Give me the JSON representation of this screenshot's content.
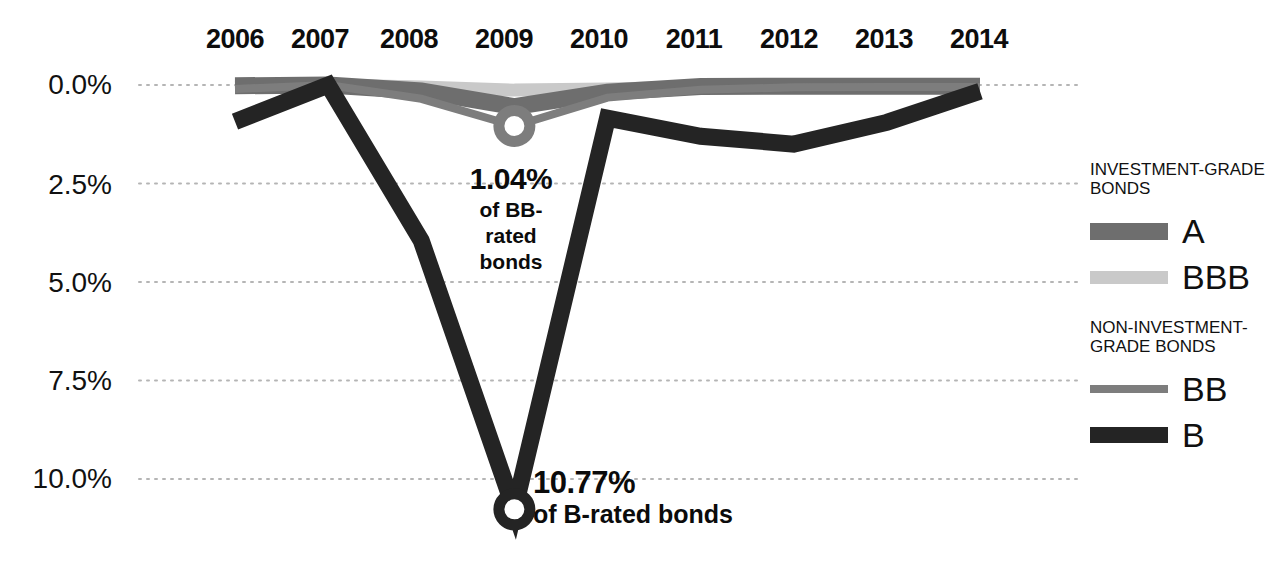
{
  "chart_data": {
    "type": "line",
    "title": "",
    "subtitle": "",
    "xlabel": "",
    "ylabel": "",
    "categories": [
      "2006",
      "2007",
      "2008",
      "2009",
      "2010",
      "2011",
      "2012",
      "2013",
      "2014"
    ],
    "x": [
      2006,
      2007,
      2008,
      2009,
      2010,
      2011,
      2012,
      2013,
      2014
    ],
    "ylim": [
      0.0,
      11.0
    ],
    "y_inverted": true,
    "yticks": [
      "0.0%",
      "2.5%",
      "5.0%",
      "7.5%",
      "10.0%"
    ],
    "ytick_values": [
      0.0,
      2.5,
      5.0,
      7.5,
      10.0
    ],
    "grid": true,
    "grid_style": "dotted-horizontal",
    "legend_position": "right",
    "series": [
      {
        "name": "A",
        "group": "INVESTMENT-GRADE BONDS",
        "color": "#6e6e6e",
        "width": 17,
        "values": [
          0.02,
          0.0,
          0.15,
          0.55,
          0.18,
          0.04,
          0.03,
          0.03,
          0.03
        ]
      },
      {
        "name": "BBB",
        "group": "INVESTMENT-GRADE BONDS",
        "color": "#c9c9c9",
        "width": 13,
        "values": [
          0.05,
          0.0,
          0.05,
          0.13,
          0.1,
          0.05,
          0.04,
          0.04,
          0.04
        ]
      },
      {
        "name": "BB",
        "group": "NON-INVESTMENT-GRADE BONDS",
        "color": "#7d7d7d",
        "width": 8,
        "values": [
          0.1,
          0.0,
          0.35,
          1.04,
          0.32,
          0.12,
          0.06,
          0.05,
          0.05
        ]
      },
      {
        "name": "B",
        "group": "NON-INVESTMENT-GRADE BONDS",
        "color": "#242424",
        "width": 17,
        "values": [
          0.93,
          0.0,
          3.95,
          10.77,
          0.84,
          1.3,
          1.5,
          0.95,
          0.16
        ]
      }
    ],
    "markers": [
      {
        "series": "BB",
        "x": 2009,
        "y": 1.04,
        "style": "open-circle"
      },
      {
        "series": "B",
        "x": 2009,
        "y": 10.77,
        "style": "open-circle"
      }
    ],
    "annotations": [
      {
        "name": "bb-callout",
        "value": "1.04%",
        "text": "of BB-rated bonds",
        "target_series": "BB",
        "target_x": 2009
      },
      {
        "name": "b-callout",
        "value": "10.77%",
        "text": "of B-rated bonds",
        "target_series": "B",
        "target_x": 2009
      }
    ]
  },
  "axis": {
    "years": [
      "2006",
      "2007",
      "2008",
      "2009",
      "2010",
      "2011",
      "2012",
      "2013",
      "2014"
    ],
    "yticks": [
      "0.0%",
      "2.5%",
      "5.0%",
      "7.5%",
      "10.0%"
    ]
  },
  "callouts": {
    "bb": {
      "value": "1.04%",
      "line1": "of BB-",
      "line2": "rated",
      "line3": "bonds"
    },
    "b": {
      "value": "10.77%",
      "text": "of B-rated bonds"
    }
  },
  "legend": {
    "group_investment": "INVESTMENT-GRADE BONDS",
    "group_non_investment": "NON-INVESTMENT-GRADE BONDS",
    "items": [
      {
        "label": "A",
        "color": "#6e6e6e"
      },
      {
        "label": "BBB",
        "color": "#c9c9c9"
      },
      {
        "label": "BB",
        "color": "#7d7d7d"
      },
      {
        "label": "B",
        "color": "#242424"
      }
    ]
  }
}
